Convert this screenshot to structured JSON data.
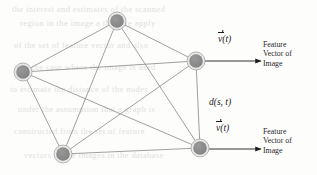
{
  "figure": {
    "background_color": "#fdfdfc",
    "node_fill": "#8a8a8a",
    "node_ring": "#e8e8e8",
    "node_stroke": "#9a9a9a",
    "edge_color": "#8f8f8f",
    "text_color": "#1c1c1c"
  },
  "graph": {
    "type": "complete-graph-k5",
    "node_radius": 9,
    "inner_radius": 6.8,
    "nodes": [
      {
        "id": "top",
        "label": "",
        "cx": 117,
        "cy": 21
      },
      {
        "id": "left",
        "label": "",
        "cx": 23,
        "cy": 72
      },
      {
        "id": "right-upper",
        "label": "",
        "cx": 196,
        "cy": 61
      },
      {
        "id": "bottom-left",
        "label": "",
        "cx": 63,
        "cy": 154
      },
      {
        "id": "bottom-right",
        "label": "",
        "cx": 200,
        "cy": 148
      }
    ],
    "edges": [
      {
        "from": "top",
        "to": "left"
      },
      {
        "from": "top",
        "to": "right-upper"
      },
      {
        "from": "top",
        "to": "bottom-left"
      },
      {
        "from": "top",
        "to": "bottom-right"
      },
      {
        "from": "left",
        "to": "right-upper"
      },
      {
        "from": "left",
        "to": "bottom-left"
      },
      {
        "from": "left",
        "to": "bottom-right"
      },
      {
        "from": "right-upper",
        "to": "bottom-left"
      },
      {
        "from": "right-upper",
        "to": "bottom-right"
      },
      {
        "from": "bottom-left",
        "to": "bottom-right"
      }
    ]
  },
  "annotations": {
    "distance_label": "d(s, t)",
    "vector_symbol_body": "v",
    "vector_symbol_suffix": "(t)",
    "top_output": {
      "vector_label_suffix": "(t)",
      "feature_lines": [
        "Feature",
        "Vector of",
        "Image"
      ]
    },
    "bottom_output": {
      "vector_label_suffix": "(t)",
      "feature_lines": [
        "Feature",
        "Vector of",
        "Image"
      ]
    }
  },
  "background_bleed": {
    "note": "faint illegible reverse-side scan text",
    "lines": [
      "the interest      and estimates      of the scanned",
      "region in      the image      a  then  we  apply",
      "of  the  set      of  feature      vector  and  also",
      "in the case      where the      image  is  used",
      "to  estimate      the  distance      of  the  nodes",
      "under the      assumption      that  a  graph  is",
      "constructed      from  the      set  of  feature",
      "vectors  of      the  images      in  the  database"
    ]
  }
}
